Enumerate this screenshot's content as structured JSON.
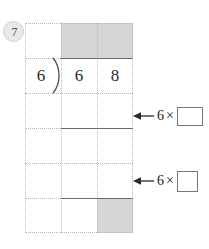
{
  "worksheet": {
    "problem_number": "7",
    "division": {
      "divisor": "6",
      "dividend_digits": [
        "6",
        "8"
      ],
      "bracket_icon": "division-bracket-icon"
    },
    "grid": {
      "columns": 3,
      "rows": 6,
      "line_style": "dotted",
      "line_color": "#b8b8b8",
      "shade_color": "#d6d6d6",
      "shaded_cells": [
        {
          "row": 0,
          "col": 1
        },
        {
          "row": 0,
          "col": 2
        },
        {
          "row": 5,
          "col": 2
        }
      ]
    },
    "rules": [
      {
        "name": "vinculum",
        "row": 1
      },
      {
        "name": "subtraction-rule-1",
        "row": 3
      },
      {
        "name": "subtraction-rule-2",
        "row": 5
      }
    ],
    "hints": [
      {
        "arrow_icon": "left-arrow-icon",
        "multiplier": "6",
        "times_symbol": "×",
        "answer_value": "",
        "box_width": 26,
        "box_height": 19
      },
      {
        "arrow_icon": "left-arrow-icon",
        "multiplier": "6",
        "times_symbol": "×",
        "answer_value": "",
        "box_width": 21,
        "box_height": 21
      }
    ]
  }
}
